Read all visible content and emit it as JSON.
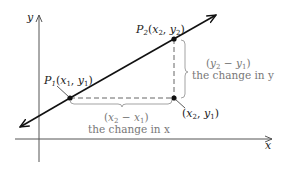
{
  "diagram": {
    "axes": {
      "x_label": "x",
      "y_label": "y"
    },
    "points": {
      "p1": {
        "name": "P",
        "sub": "1",
        "coords": "(x1, y1)",
        "label_x": "x",
        "label_x_sub": "1",
        "label_y": "y",
        "label_y_sub": "1"
      },
      "p2": {
        "name": "P",
        "sub": "2",
        "coords": "(x2, y2)",
        "label_x": "x",
        "label_x_sub": "2",
        "label_y": "y",
        "label_y_sub": "2"
      },
      "p3": {
        "coords": "(x2, y1)",
        "label_x": "x",
        "label_x_sub": "2",
        "label_y": "y",
        "label_y_sub": "1"
      }
    },
    "horizontal_change": {
      "expression": "(x2 − x1)",
      "a": "x",
      "a_sub": "2",
      "b": "x",
      "b_sub": "1",
      "caption": "the change in x"
    },
    "vertical_change": {
      "expression": "(y2 − y1)",
      "a": "y",
      "a_sub": "2",
      "b": "y",
      "b_sub": "1",
      "caption": "the change in y"
    },
    "colors": {
      "axis": "#555555",
      "line": "#111111",
      "dashed": "#666666",
      "annotation": "#777777"
    }
  }
}
